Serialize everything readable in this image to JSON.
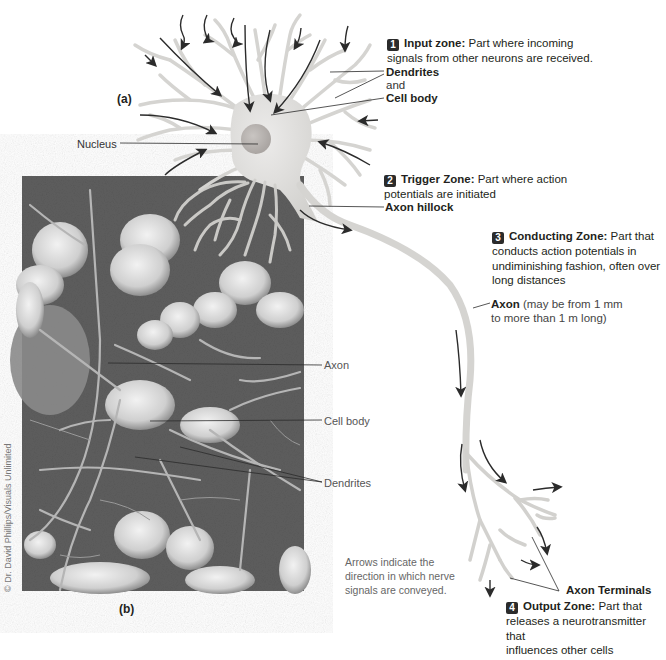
{
  "figure": {
    "panel_a_label": "(a)",
    "panel_b_label": "(b)",
    "credit": "© Dr. David Phillips/Visuals Unlimited",
    "zones": [
      {
        "number": "1",
        "title": "Input zone:",
        "desc_line1": "Part where incoming",
        "desc_line2": "signals from other neurons are received."
      },
      {
        "number": "2",
        "title": "Trigger Zone:",
        "desc_line1": "Part where action",
        "desc_line2": "potentials are initiated"
      },
      {
        "number": "3",
        "title": "Conducting Zone:",
        "desc_line1": "Part that",
        "desc_line2": "conducts action potentials in",
        "desc_line3": "undiminishing fashion, often over",
        "desc_line4": "long distances"
      },
      {
        "number": "4",
        "title": "Output Zone:",
        "desc_line1": "Part that",
        "desc_line2": "releases a neurotransmitter that",
        "desc_line3": "influences other cells"
      }
    ],
    "labels_a": {
      "dendrites": "Dendrites",
      "and": "and",
      "cell_body": "Cell body",
      "nucleus": "Nucleus",
      "axon_hillock": "Axon hillock",
      "axon": "Axon",
      "axon_note_line1": "(may be from 1 mm",
      "axon_note_line2": "to more than 1 m long)",
      "axon_terminals": "Axon Terminals"
    },
    "labels_b": {
      "axon": "Axon",
      "cell_body": "Cell body",
      "dendrites": "Dendrites"
    },
    "arrows_note": {
      "line1": "Arrows indicate the",
      "line2": "direction in which nerve",
      "line3": "signals are conveyed."
    },
    "colors": {
      "neuron_fill": "#d9d9d6",
      "nucleus_fill": "#bdb9b6",
      "micrograph_bg": "#5c5c5c",
      "arrow": "#2b2b2b",
      "badge": "#2b2b2b"
    }
  }
}
